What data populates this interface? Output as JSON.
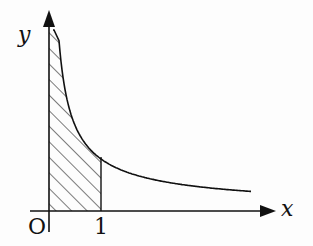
{
  "labels": {
    "y_axis": "y",
    "x_axis": "x",
    "origin": "O",
    "tick_1": "1"
  },
  "figure": {
    "curve_color": "#111111",
    "hatch_color": "#222222"
  }
}
